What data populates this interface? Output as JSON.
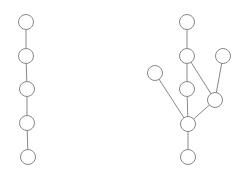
{
  "diagram": {
    "colors": {
      "stroke": "#888888",
      "fill": "#ffffff",
      "background": "#ffffff"
    },
    "node_radius": 7.5,
    "graphs": [
      {
        "name": "path-graph",
        "nodes": [
          {
            "id": "a1",
            "x": 26,
            "y": 22
          },
          {
            "id": "a2",
            "x": 26,
            "y": 56
          },
          {
            "id": "a3",
            "x": 27,
            "y": 89
          },
          {
            "id": "a4",
            "x": 27,
            "y": 123
          },
          {
            "id": "a5",
            "x": 28,
            "y": 157
          }
        ],
        "edges": [
          [
            "a1",
            "a2"
          ],
          [
            "a2",
            "a3"
          ],
          [
            "a3",
            "a4"
          ],
          [
            "a4",
            "a5"
          ]
        ]
      },
      {
        "name": "tree-graph",
        "nodes": [
          {
            "id": "b1",
            "x": 187,
            "y": 22
          },
          {
            "id": "b2",
            "x": 187,
            "y": 56
          },
          {
            "id": "b3",
            "x": 223,
            "y": 56
          },
          {
            "id": "b4",
            "x": 155,
            "y": 73
          },
          {
            "id": "b5",
            "x": 187,
            "y": 89
          },
          {
            "id": "b6",
            "x": 215,
            "y": 100
          },
          {
            "id": "b7",
            "x": 188,
            "y": 124
          },
          {
            "id": "b8",
            "x": 188,
            "y": 157
          }
        ],
        "edges": [
          [
            "b1",
            "b2"
          ],
          [
            "b2",
            "b5"
          ],
          [
            "b2",
            "b6"
          ],
          [
            "b3",
            "b6"
          ],
          [
            "b4",
            "b7"
          ],
          [
            "b5",
            "b7"
          ],
          [
            "b6",
            "b7"
          ],
          [
            "b7",
            "b8"
          ]
        ]
      }
    ]
  }
}
